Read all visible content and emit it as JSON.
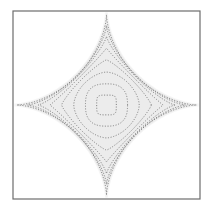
{
  "figure": {
    "title": "",
    "width": 213,
    "height": 217,
    "background_color": "#ffffff"
  },
  "frame": {
    "name": "plot-border",
    "x": 13,
    "y": 11,
    "width": 187,
    "height": 188,
    "stroke_color": "#6d6d6d",
    "stroke_width": 1.2,
    "fill_color": "#ffffff"
  },
  "region": {
    "name": "astroid-shaded-region",
    "fill_color": "#ececec",
    "description": "four-pointed concave star (astroid) shaded area",
    "exponent": 0.62
  },
  "contours": {
    "stroke_color": "#6b6b6b",
    "stroke_width": 0.85,
    "dash_pattern": "1.1 1.6",
    "count": 8
  },
  "chart_data": {
    "type": "line",
    "title": "",
    "subtitle": "",
    "xlabel": "",
    "ylabel": "",
    "xlim": [
      -1,
      1
    ],
    "ylim": [
      -1,
      1
    ],
    "grid": false,
    "legend": "none",
    "annotations": [],
    "series": [
      {
        "name": "contour-1",
        "level": 1.0,
        "exponent": 0.62,
        "radius": 0.96,
        "style": "dotted"
      },
      {
        "name": "contour-2",
        "level": 0.88,
        "exponent": 0.7,
        "radius": 0.845,
        "style": "dotted"
      },
      {
        "name": "contour-3",
        "level": 0.76,
        "exponent": 0.8,
        "radius": 0.73,
        "style": "dotted"
      },
      {
        "name": "contour-4",
        "level": 0.64,
        "exponent": 0.95,
        "radius": 0.605,
        "style": "dotted"
      },
      {
        "name": "contour-5",
        "level": 0.52,
        "exponent": 1.2,
        "radius": 0.48,
        "style": "dotted"
      },
      {
        "name": "contour-6",
        "level": 0.4,
        "exponent": 1.7,
        "radius": 0.35,
        "style": "dotted"
      },
      {
        "name": "contour-7",
        "level": 0.28,
        "exponent": 2.6,
        "radius": 0.225,
        "style": "dotted"
      },
      {
        "name": "contour-8",
        "level": 0.16,
        "exponent": 4.5,
        "radius": 0.105,
        "style": "dotted"
      }
    ],
    "categories": [
      "contour-1",
      "contour-2",
      "contour-3",
      "contour-4",
      "contour-5",
      "contour-6",
      "contour-7",
      "contour-8"
    ],
    "values": [
      1.0,
      0.88,
      0.76,
      0.64,
      0.52,
      0.4,
      0.28,
      0.16
    ]
  }
}
